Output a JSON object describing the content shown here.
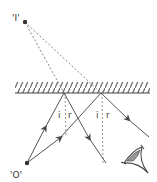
{
  "diagram": {
    "type": "plane-mirror-reflection",
    "labels": {
      "image": "'I'",
      "object": "'O'",
      "incidence_angle": "i",
      "reflection_angle": "r"
    },
    "points": {
      "image": {
        "x": 25,
        "y": 22
      },
      "object": {
        "x": 27,
        "y": 163
      },
      "reflection_a": {
        "x": 64,
        "y": 93
      },
      "reflection_b": {
        "x": 101,
        "y": 93
      }
    },
    "mirror": {
      "x1": 15,
      "x2": 150,
      "y": 93,
      "hatch_top": 82
    },
    "colors": {
      "line": "#555555",
      "dashed": "#777777",
      "point": "#333333",
      "background": "#ffffff"
    },
    "eye_icon": "eye-icon"
  }
}
